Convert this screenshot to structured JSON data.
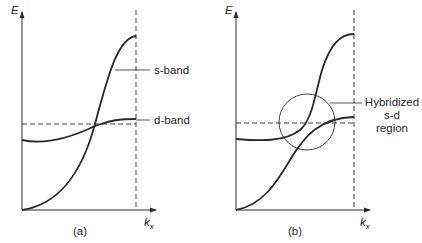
{
  "panels": [
    {
      "id": "a",
      "caption": "(a)",
      "y_axis_label": "E",
      "x_axis_label": "k",
      "x_axis_subscript": "x",
      "curves": [
        {
          "name": "s-band",
          "label": "s-band"
        },
        {
          "name": "d-band",
          "label": "d-band"
        }
      ]
    },
    {
      "id": "b",
      "caption": "(b)",
      "y_axis_label": "E",
      "x_axis_label": "k",
      "x_axis_subscript": "x",
      "annotation": {
        "line1": "Hybridized",
        "line2": "s-d",
        "line3": "region"
      }
    }
  ],
  "colors": {
    "ink": "#2a2a2a",
    "background": "#ffffff"
  }
}
